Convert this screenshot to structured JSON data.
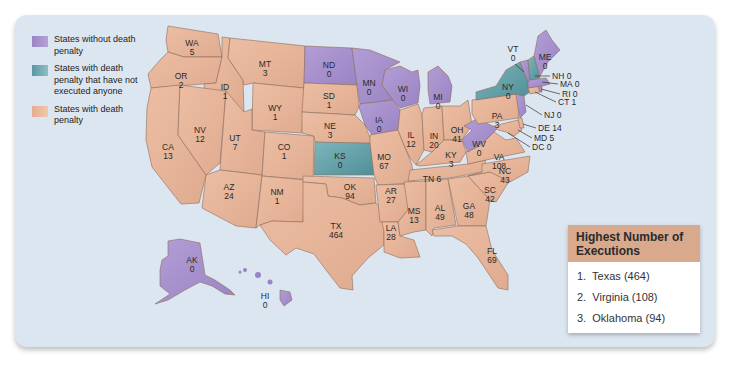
{
  "colors": {
    "no_death_penalty": "#a993cc",
    "death_penalty_no_executions": "#6aa6ad",
    "death_penalty": "#e6b49a",
    "background_panel": "#dce6f1",
    "box_header": "#d9a98e"
  },
  "legend": {
    "items": [
      {
        "key": "no_death_penalty",
        "label": "States without death penalty"
      },
      {
        "key": "death_penalty_no_executions",
        "label": "States with death penalty that have not executed anyone"
      },
      {
        "key": "death_penalty",
        "label": "States with death penalty"
      }
    ]
  },
  "states": {
    "WA": {
      "abbr": "WA",
      "executions": "5",
      "category": "death_penalty"
    },
    "OR": {
      "abbr": "OR",
      "executions": "2",
      "category": "death_penalty"
    },
    "CA": {
      "abbr": "CA",
      "executions": "13",
      "category": "death_penalty"
    },
    "ID": {
      "abbr": "ID",
      "executions": "1",
      "category": "death_penalty"
    },
    "NV": {
      "abbr": "NV",
      "executions": "12",
      "category": "death_penalty"
    },
    "MT": {
      "abbr": "MT",
      "executions": "3",
      "category": "death_penalty"
    },
    "WY": {
      "abbr": "WY",
      "executions": "1",
      "category": "death_penalty"
    },
    "UT": {
      "abbr": "UT",
      "executions": "7",
      "category": "death_penalty"
    },
    "CO": {
      "abbr": "CO",
      "executions": "1",
      "category": "death_penalty"
    },
    "AZ": {
      "abbr": "AZ",
      "executions": "24",
      "category": "death_penalty"
    },
    "NM": {
      "abbr": "NM",
      "executions": "1",
      "category": "death_penalty"
    },
    "ND": {
      "abbr": "ND",
      "executions": "0",
      "category": "no_death_penalty"
    },
    "SD": {
      "abbr": "SD",
      "executions": "1",
      "category": "death_penalty"
    },
    "NE": {
      "abbr": "NE",
      "executions": "3",
      "category": "death_penalty"
    },
    "KS": {
      "abbr": "KS",
      "executions": "0",
      "category": "death_penalty_no_executions"
    },
    "OK": {
      "abbr": "OK",
      "executions": "94",
      "category": "death_penalty"
    },
    "TX": {
      "abbr": "TX",
      "executions": "464",
      "category": "death_penalty"
    },
    "MN": {
      "abbr": "MN",
      "executions": "0",
      "category": "no_death_penalty"
    },
    "IA": {
      "abbr": "IA",
      "executions": "0",
      "category": "no_death_penalty"
    },
    "MO": {
      "abbr": "MO",
      "executions": "67",
      "category": "death_penalty"
    },
    "AR": {
      "abbr": "AR",
      "executions": "27",
      "category": "death_penalty"
    },
    "LA": {
      "abbr": "LA",
      "executions": "28",
      "category": "death_penalty"
    },
    "WI": {
      "abbr": "WI",
      "executions": "0",
      "category": "no_death_penalty"
    },
    "IL": {
      "abbr": "IL",
      "executions": "12",
      "category": "death_penalty"
    },
    "MI": {
      "abbr": "MI",
      "executions": "0",
      "category": "no_death_penalty"
    },
    "IN": {
      "abbr": "IN",
      "executions": "20",
      "category": "death_penalty"
    },
    "OH": {
      "abbr": "OH",
      "executions": "41",
      "category": "death_penalty"
    },
    "KY": {
      "abbr": "KY",
      "executions": "3",
      "category": "death_penalty"
    },
    "TN": {
      "abbr": "TN",
      "executions": "6",
      "category": "death_penalty"
    },
    "MS": {
      "abbr": "MS",
      "executions": "13",
      "category": "death_penalty"
    },
    "AL": {
      "abbr": "AL",
      "executions": "49",
      "category": "death_penalty"
    },
    "GA": {
      "abbr": "GA",
      "executions": "48",
      "category": "death_penalty"
    },
    "FL": {
      "abbr": "FL",
      "executions": "69",
      "category": "death_penalty"
    },
    "SC": {
      "abbr": "SC",
      "executions": "42",
      "category": "death_penalty"
    },
    "NC": {
      "abbr": "NC",
      "executions": "43",
      "category": "death_penalty"
    },
    "VA": {
      "abbr": "VA",
      "executions": "108",
      "category": "death_penalty"
    },
    "WV": {
      "abbr": "WV",
      "executions": "0",
      "category": "no_death_penalty"
    },
    "PA": {
      "abbr": "PA",
      "executions": "3",
      "category": "death_penalty"
    },
    "NY": {
      "abbr": "NY",
      "executions": "0",
      "category": "death_penalty_no_executions"
    },
    "VT": {
      "abbr": "VT",
      "executions": "0",
      "category": "no_death_penalty"
    },
    "ME": {
      "abbr": "ME",
      "executions": "0",
      "category": "no_death_penalty"
    },
    "NH": {
      "abbr": "NH",
      "executions": "0",
      "category": "death_penalty_no_executions"
    },
    "MA": {
      "abbr": "MA",
      "executions": "0",
      "category": "no_death_penalty"
    },
    "RI": {
      "abbr": "RI",
      "executions": "0",
      "category": "no_death_penalty"
    },
    "CT": {
      "abbr": "CT",
      "executions": "1",
      "category": "death_penalty"
    },
    "NJ": {
      "abbr": "NJ",
      "executions": "0",
      "category": "no_death_penalty"
    },
    "DE": {
      "abbr": "DE",
      "executions": "14",
      "category": "death_penalty"
    },
    "MD": {
      "abbr": "MD",
      "executions": "5",
      "category": "death_penalty"
    },
    "DC": {
      "abbr": "DC",
      "executions": "0",
      "category": "no_death_penalty"
    },
    "AK": {
      "abbr": "AK",
      "executions": "0",
      "category": "no_death_penalty"
    },
    "HI": {
      "abbr": "HI",
      "executions": "0",
      "category": "no_death_penalty"
    }
  },
  "callouts": {
    "NH": "NH 0",
    "MA": "MA 0",
    "RI": "RI 0",
    "CT": "CT 1",
    "NJ": "NJ 0",
    "DE": "DE 14",
    "MD": "MD 5",
    "DC": "DC 0",
    "TN": "TN 6"
  },
  "top_executions": {
    "title": "Highest Number of Executions",
    "items": [
      {
        "rank": "1.",
        "label": "Texas (464)"
      },
      {
        "rank": "2.",
        "label": "Virginia (108)"
      },
      {
        "rank": "3.",
        "label": "Oklahoma (94)"
      }
    ]
  }
}
